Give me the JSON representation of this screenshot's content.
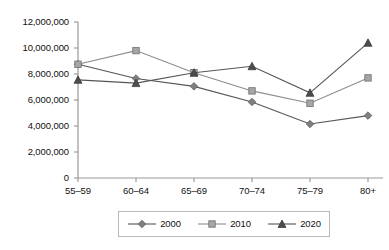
{
  "chart_data": {
    "type": "line",
    "title": "",
    "subtitle": "",
    "xlabel": "",
    "ylabel": "",
    "categories": [
      "55–59",
      "60–64",
      "65–69",
      "70–74",
      "75–79",
      "80+"
    ],
    "ylim": [
      0,
      12000000
    ],
    "ytick_values": [
      0,
      2000000,
      4000000,
      6000000,
      8000000,
      10000000,
      12000000
    ],
    "ytick_labels": [
      "0",
      "2,000,000",
      "4,000,000",
      "6,000,000",
      "8,000,000",
      "10,000,000",
      "12,000,000"
    ],
    "grid": false,
    "legend_position": "bottom",
    "series": [
      {
        "name": "2000",
        "marker": "diamond",
        "color": "#808080",
        "values": [
          8750000,
          7650000,
          7050000,
          5850000,
          4150000,
          4800000
        ]
      },
      {
        "name": "2010",
        "marker": "square",
        "color": "#a6a6a6",
        "values": [
          8750000,
          9800000,
          8100000,
          6700000,
          5750000,
          7700000
        ]
      },
      {
        "name": "2020",
        "marker": "triangle",
        "color": "#4d4d4d",
        "values": [
          7550000,
          7300000,
          8100000,
          8600000,
          6550000,
          10400000
        ]
      }
    ]
  },
  "axes": {
    "axis_color": "#999999",
    "tick_color": "#999999"
  },
  "legend": {
    "entries": [
      {
        "label": "2000",
        "marker": "diamond-marker-icon"
      },
      {
        "label": "2010",
        "marker": "square-marker-icon"
      },
      {
        "label": "2020",
        "marker": "triangle-marker-icon"
      }
    ]
  }
}
